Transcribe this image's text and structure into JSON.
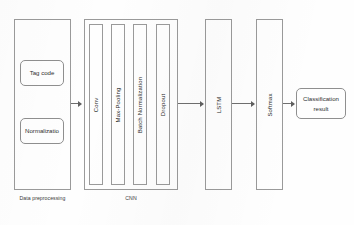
{
  "diagram": {
    "stroke_color": "#9a9a9a",
    "text_color": "#2e2e2e",
    "background": "#fefefe"
  },
  "stages": {
    "preprocessing": {
      "group_label": "Data preprocessing",
      "boxes": [
        {
          "label": "Tag code"
        },
        {
          "label": "Normalizatio"
        }
      ]
    },
    "cnn": {
      "group_label": "CNN",
      "layers": [
        {
          "label": "Conv"
        },
        {
          "label": "Max-Pooling"
        },
        {
          "label": "Batch Normalization"
        },
        {
          "label": "Dropout"
        }
      ]
    },
    "lstm": {
      "label": "LSTM"
    },
    "softmax": {
      "label": "Softmax"
    },
    "result": {
      "line1": "Classification",
      "line2": "result"
    }
  },
  "arrows": [
    {
      "name": "preprocessing-to-cnn"
    },
    {
      "name": "cnn-to-lstm"
    },
    {
      "name": "lstm-to-softmax"
    },
    {
      "name": "softmax-to-result"
    }
  ]
}
